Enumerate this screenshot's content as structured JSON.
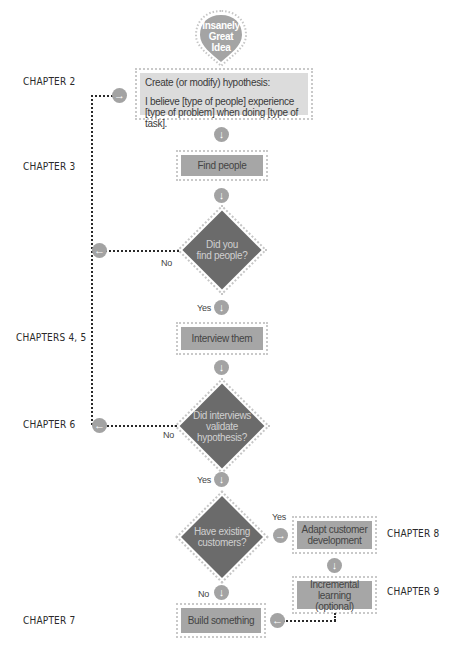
{
  "start": {
    "label_lines": [
      "Insanely",
      "Great",
      "Idea"
    ]
  },
  "chapters": {
    "c2": "CHAPTER 2",
    "c3": "CHAPTER 3",
    "c45": "CHAPTERS 4, 5",
    "c6": "CHAPTER 6",
    "c7": "CHAPTER 7",
    "c8": "CHAPTER 8",
    "c9": "CHAPTER 9"
  },
  "nodes": {
    "hypothesis": {
      "title": "Create (or modify) hypothesis:",
      "line1": "I believe [type of people] experience",
      "line2": "[type of problem] when doing [type of task]."
    },
    "find_people": "Find people",
    "did_find": {
      "line1": "Did you",
      "line2": "find people?"
    },
    "interview": "Interview them",
    "validate": {
      "line1": "Did interviews",
      "line2": "validate",
      "line3": "hypothesis?"
    },
    "existing": {
      "line1": "Have existing",
      "line2": "customers?"
    },
    "adapt": {
      "line1": "Adapt customer",
      "line2": "development"
    },
    "incremental": {
      "line1": "Incremental learning",
      "line2": "(optional)"
    },
    "build": "Build something"
  },
  "edge_labels": {
    "no1": "No",
    "yes1": "Yes",
    "no2": "No",
    "yes2": "Yes",
    "yes3": "Yes",
    "no3": "No"
  },
  "icons": {
    "down": "↓",
    "right": "→",
    "left": "←"
  },
  "colors": {
    "dark_node": "#6b6b6b",
    "mid_node": "#a6a6a6",
    "light_node": "#dcdcdc",
    "connector": "#a3a3a3"
  }
}
